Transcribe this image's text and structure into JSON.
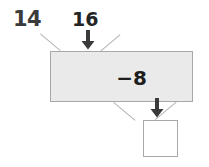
{
  "problem": {
    "number": "14",
    "input_value": "16",
    "operation": "−8",
    "answer_value": "",
    "input_arrow_icon": "arrow-down-icon",
    "output_arrow_icon": "arrow-down-icon"
  },
  "colors": {
    "machine_fill": "#eaeaea",
    "machine_border": "#a8a8a8",
    "guide_line": "#b4b4b4",
    "arrow": "#3a3a3a",
    "text": "#1d1d1d",
    "question_number": "#3b3b3b",
    "answer_box_fill": "#ffffff",
    "page_background": "#ffffff"
  }
}
